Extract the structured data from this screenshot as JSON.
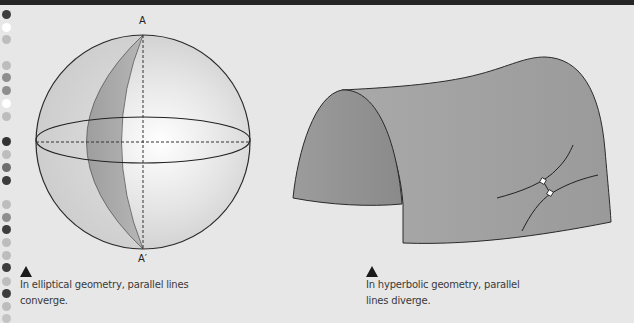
{
  "page": {
    "background": "#e7e7e7",
    "topbar_color": "#262626"
  },
  "margin_dots": [
    {
      "y": 14,
      "color": "#3c3c3c"
    },
    {
      "y": 27,
      "color": "#ffffff"
    },
    {
      "y": 39,
      "color": "#bdbdbd"
    },
    {
      "y": 65,
      "color": "#bdbdbd"
    },
    {
      "y": 77,
      "color": "#8e8e8e"
    },
    {
      "y": 90,
      "color": "#8e8e8e"
    },
    {
      "y": 103,
      "color": "#ffffff"
    },
    {
      "y": 116,
      "color": "#bdbdbd"
    },
    {
      "y": 141,
      "color": "#333333"
    },
    {
      "y": 154,
      "color": "#bdbdbd"
    },
    {
      "y": 167,
      "color": "#6e6e6e"
    },
    {
      "y": 180,
      "color": "#3c3c3c"
    },
    {
      "y": 204,
      "color": "#bdbdbd"
    },
    {
      "y": 217,
      "color": "#8e8e8e"
    },
    {
      "y": 229,
      "color": "#3c3c3c"
    },
    {
      "y": 242,
      "color": "#bdbdbd"
    },
    {
      "y": 255,
      "color": "#bdbdbd"
    },
    {
      "y": 267,
      "color": "#3c3c3c"
    },
    {
      "y": 281,
      "color": "#bdbdbd"
    },
    {
      "y": 293,
      "color": "#3c3c3c"
    },
    {
      "y": 306,
      "color": "#bdbdbd"
    },
    {
      "y": 318,
      "color": "#c4c4c4"
    }
  ],
  "elliptical": {
    "label_top": "A",
    "label_bottom": "A′",
    "caption_line1": "In elliptical geometry, parallel lines",
    "caption_line2": "converge."
  },
  "hyperbolic": {
    "caption_line1": "In hyperbolic geometry, parallel",
    "caption_line2": "lines diverge."
  }
}
